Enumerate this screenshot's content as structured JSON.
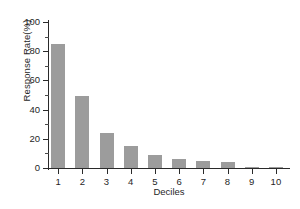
{
  "chart_data": {
    "type": "bar",
    "title": "",
    "subtitle": "",
    "xlabel": "Deciles",
    "ylabel": "Response Rate(%)",
    "categories": [
      "1",
      "2",
      "3",
      "4",
      "5",
      "6",
      "7",
      "8",
      "9",
      "10"
    ],
    "values": [
      85,
      49,
      24,
      15,
      9,
      6,
      4.5,
      4,
      1,
      0.8
    ],
    "series": [
      {
        "name": "Response Rate",
        "values": [
          85,
          49,
          24,
          15,
          9,
          6,
          4.5,
          4,
          1,
          0.8
        ]
      }
    ],
    "ylim": [
      0,
      100
    ],
    "ytick_labels": [
      "0",
      "20",
      "40",
      "60",
      "80",
      "100"
    ],
    "ytick_values": [
      0,
      20,
      40,
      60,
      80,
      100
    ],
    "yminor_values": [
      10,
      30,
      50,
      70,
      90
    ],
    "grid": false,
    "legend": false,
    "legend_position": "none",
    "bar_color": "#9c9c9c",
    "axis_color": "#2a2a2a",
    "background_color": "#ffffff",
    "annotations": []
  }
}
